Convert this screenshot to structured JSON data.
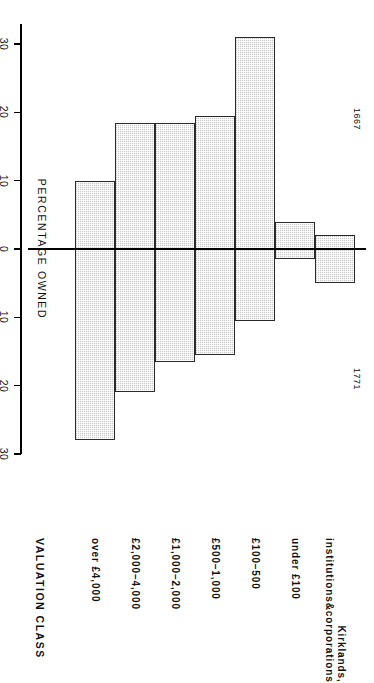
{
  "figure": {
    "header": "VALUATION CLASS",
    "axis_title": "PERCENTAGE OWNED",
    "period_upper": "1771",
    "period_lower": "1667"
  },
  "axis": {
    "ticks": [
      {
        "label": "30",
        "value": 30
      },
      {
        "label": "20",
        "value": 20
      },
      {
        "label": "10",
        "value": 10
      },
      {
        "label": "0",
        "value": 0
      },
      {
        "label": "10",
        "value": -10
      },
      {
        "label": "20",
        "value": -20
      },
      {
        "label": "30",
        "value": -30
      }
    ]
  },
  "chart_data": {
    "type": "bar",
    "title": "VALUATION CLASS",
    "xlabel": "VALUATION CLASS",
    "ylabel": "PERCENTAGE OWNED",
    "ylim": [
      -33,
      30
    ],
    "grid": false,
    "legend": null,
    "orientation": "vertical-diverging",
    "categories": [
      "over £4,000",
      "£2,000–4,000",
      "£1,000–2,000",
      "£500–1,000",
      "£100–500",
      "under £100",
      "Kirklands, institutions&corporations"
    ],
    "series": [
      {
        "name": "1771",
        "values": [
          28,
          21,
          16.5,
          15.5,
          10.5,
          1.5,
          5
        ]
      },
      {
        "name": "1667",
        "values": [
          -10,
          -18.5,
          -18.5,
          -19.5,
          -31,
          -4,
          -2
        ]
      }
    ]
  },
  "bars": [
    {
      "label": "over £4,000",
      "upper": 28,
      "lower": -10
    },
    {
      "label": "£2,000–4,000",
      "upper": 21,
      "lower": -18.5
    },
    {
      "label": "£1,000–2,000",
      "upper": 16.5,
      "lower": -18.5
    },
    {
      "label": "£500–1,000",
      "upper": 15.5,
      "lower": -19.5
    },
    {
      "label": "£100–500",
      "upper": 10.5,
      "lower": -31
    },
    {
      "label": "under £100",
      "upper": 1.5,
      "lower": -4
    },
    {
      "label": "Kirklands,|institutions&corporations",
      "upper": 5,
      "lower": -2
    }
  ]
}
